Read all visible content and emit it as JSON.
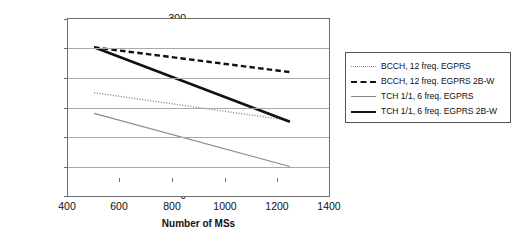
{
  "chart_data": {
    "type": "line",
    "title": "",
    "xlabel": "Number of MSs",
    "ylabel": "Mean session throughput [kbit/s]",
    "xlim": [
      400,
      1400
    ],
    "ylim": [
      0,
      300
    ],
    "xticks": [
      400,
      600,
      800,
      1000,
      1200,
      1400
    ],
    "yticks": [
      0,
      50,
      100,
      150,
      200,
      250,
      300
    ],
    "grid": "horizontal",
    "legend_position": "right-outside",
    "x": [
      500,
      1250
    ],
    "series": [
      {
        "name": "BCCH, 12 freq. EGPRS",
        "style": "dotted",
        "color": "#8c8c8c",
        "x": [
          500,
          1250
        ],
        "values": [
          175,
          128
        ]
      },
      {
        "name": "BCCH, 12 freq. EGPRS 2B-W",
        "style": "dashed",
        "color": "#111111",
        "x": [
          500,
          1250
        ],
        "values": [
          252,
          210
        ]
      },
      {
        "name": "TCH 1/1, 6 freq. EGPRS",
        "style": "thin-solid",
        "color": "#8a8a8a",
        "x": [
          500,
          1250
        ],
        "values": [
          140,
          50
        ]
      },
      {
        "name": "TCH 1/1, 6 freq. EGPRS 2B-W",
        "style": "thick-solid",
        "color": "#111111",
        "x": [
          500,
          1250
        ],
        "values": [
          252,
          126
        ]
      }
    ]
  },
  "axes": {
    "y_title": "Mean session throughput [kbit/s]",
    "x_title": "Number of MSs",
    "y_labels": [
      "300",
      "250",
      "200",
      "150",
      "100",
      "50",
      "0"
    ],
    "x_labels": [
      "400",
      "600",
      "800",
      "1000",
      "1200",
      "1400"
    ]
  },
  "legend": {
    "items": [
      {
        "label": "BCCH, 12 freq. EGPRS"
      },
      {
        "label": "BCCH, 12 freq. EGPRS 2B-W"
      },
      {
        "label": "TCH 1/1, 6 freq. EGPRS"
      },
      {
        "label": "TCH 1/1, 6 freq. EGPRS 2B-W"
      }
    ]
  }
}
